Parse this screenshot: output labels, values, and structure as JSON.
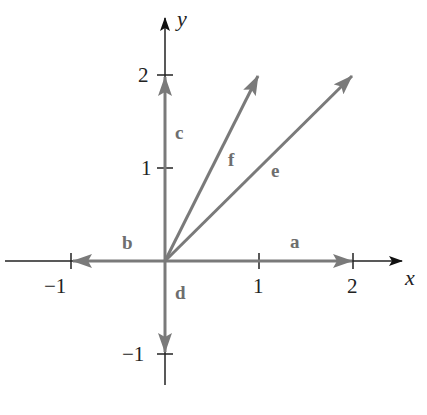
{
  "diagram": {
    "type": "vector-plot",
    "axes": {
      "x_label": "x",
      "y_label": "y",
      "x_ticks": [
        {
          "value": -1,
          "label": "−1"
        },
        {
          "value": 1,
          "label": "1"
        },
        {
          "value": 2,
          "label": "2"
        }
      ],
      "y_ticks": [
        {
          "value": -1,
          "label": "−1"
        },
        {
          "value": 1,
          "label": "1"
        },
        {
          "value": 2,
          "label": "2"
        }
      ]
    },
    "vectors": [
      {
        "name": "a",
        "from": [
          0,
          0
        ],
        "to": [
          2,
          0
        ]
      },
      {
        "name": "b",
        "from": [
          0,
          0
        ],
        "to": [
          -1,
          0
        ]
      },
      {
        "name": "c",
        "from": [
          0,
          0
        ],
        "to": [
          0,
          2
        ]
      },
      {
        "name": "d",
        "from": [
          0,
          0
        ],
        "to": [
          0,
          -1
        ]
      },
      {
        "name": "e",
        "from": [
          0,
          0
        ],
        "to": [
          2,
          2
        ]
      },
      {
        "name": "f",
        "from": [
          0,
          0
        ],
        "to": [
          1,
          2
        ]
      }
    ],
    "colors": {
      "axis": "#111111",
      "vector": "#7a7a7a",
      "text": "#222222"
    }
  }
}
